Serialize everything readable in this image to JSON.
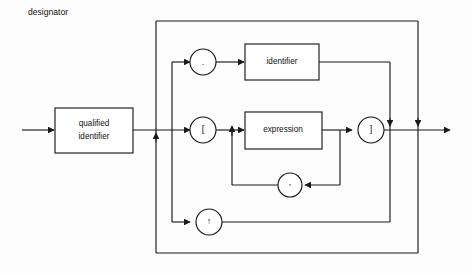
{
  "diagram": {
    "title": "designator",
    "type": "railroad-syntax-diagram",
    "boxes": [
      {
        "id": "qualified-identifier",
        "label_line1": "qualified",
        "label_line2": "identifier"
      },
      {
        "id": "identifier",
        "label": "identifier"
      },
      {
        "id": "expression",
        "label": "expression"
      }
    ],
    "terminals": [
      {
        "id": "dot",
        "label": "."
      },
      {
        "id": "lbracket",
        "label": "["
      },
      {
        "id": "rbracket",
        "label": "]"
      },
      {
        "id": "comma",
        "label": ","
      },
      {
        "id": "caret",
        "label": "↑"
      }
    ],
    "colors": {
      "line": "#1a1a1a",
      "box_fill": "#ffffff",
      "background": "#fdfdfd",
      "text": "#111111"
    }
  }
}
